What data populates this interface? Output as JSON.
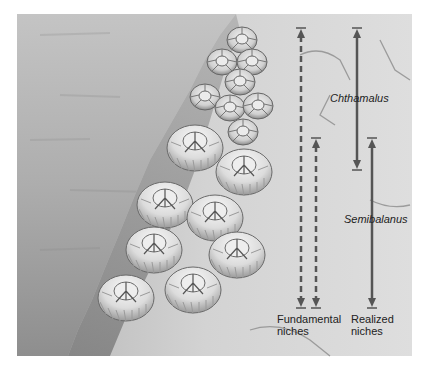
{
  "figure": {
    "background_colors": {
      "page": "#ffffff",
      "water": "#b9b9b9",
      "rock": "#d6d6d6",
      "arrow": "#555555"
    }
  },
  "species_labels": {
    "chthamalus": "Chthamalus",
    "semibalanus": "Semibalanus"
  },
  "legend": {
    "fundamental_line1": "Fundamental",
    "fundamental_line2": "niches",
    "realized_line1": "Realized",
    "realized_line2": "niches"
  },
  "arrows": [
    {
      "name": "chthamalus-fundamental-niche",
      "style": "dashed",
      "x": 301,
      "y_top": 28,
      "y_bottom": 308
    },
    {
      "name": "semibalanus-fundamental-niche",
      "style": "dashed",
      "x": 316,
      "y_top": 138,
      "y_bottom": 308
    },
    {
      "name": "chthamalus-realized-niche",
      "style": "solid",
      "x": 357,
      "y_top": 28,
      "y_bottom": 170
    },
    {
      "name": "semibalanus-realized-niche",
      "style": "solid",
      "x": 372,
      "y_top": 138,
      "y_bottom": 308
    }
  ],
  "organisms": {
    "small_barnacles": "Chthamalus barnacles (upper zone)",
    "large_barnacles": "Semibalanus barnacles (lower zone)"
  }
}
